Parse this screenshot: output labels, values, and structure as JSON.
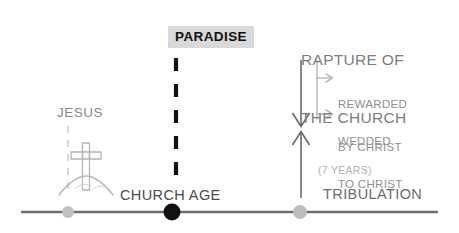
{
  "diagram": {
    "title_text": "RAPTURE OF THE CHURCH",
    "heading": {
      "line1": "RAPTURE OF",
      "line2": "THE CHURCH",
      "color": "#7d7d7d"
    },
    "paradise": {
      "label": "PARADISE",
      "text_color": "#101010",
      "box_color": "#d9d9d9"
    },
    "jesus": {
      "label": "JESUS",
      "color": "#8a8a8a",
      "icon": "cross-on-hill-icon"
    },
    "church_age": {
      "label": "CHURCH AGE",
      "color": "#4b4b4b"
    },
    "tribulation": {
      "label": "TRIBULATION",
      "duration_label": "(7 YEARS)",
      "color": "#6b6b6b",
      "duration_color": "#b0b0b0"
    },
    "outcomes": [
      {
        "line1": "REWARDED",
        "line2": "BY CHRIST",
        "color": "#909090"
      },
      {
        "line1": "WEDDED",
        "line2": "TO CHRIST",
        "color": "#909090"
      }
    ],
    "timeline": {
      "line_color": "#6e6e6e",
      "markers": [
        {
          "name": "jesus-marker",
          "x": 68,
          "color": "#c0c0c0",
          "radius": 6
        },
        {
          "name": "church-age-marker",
          "x": 172,
          "color": "#111111",
          "radius": 8
        },
        {
          "name": "tribulation-marker",
          "x": 300,
          "color": "#bdbdbd",
          "radius": 7
        }
      ]
    },
    "connectors": {
      "paradise_dashed_color": "#111111",
      "jesus_dashed_color": "#cfcfcf",
      "rapture_arrow_color": "#6a6a6a",
      "branch_arrow_color": "#bcbcbc"
    }
  }
}
